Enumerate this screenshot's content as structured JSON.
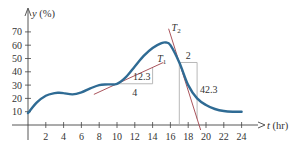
{
  "chart_data": {
    "type": "line",
    "title": "",
    "xlabel": "t (hr)",
    "ylabel": "y (%)",
    "x_axis_var": "t",
    "x_axis_unit": "(hr)",
    "y_axis_var": "y",
    "y_axis_unit": "(%)",
    "xlim": [
      0,
      24
    ],
    "ylim": [
      0,
      70
    ],
    "xticks": [
      2,
      4,
      6,
      8,
      10,
      12,
      14,
      16,
      18,
      20,
      22,
      24
    ],
    "yticks": [
      10,
      20,
      30,
      40,
      50,
      60,
      70
    ],
    "grid": false,
    "series": [
      {
        "name": "y(t)",
        "color": "#2f6b94",
        "x": [
          0,
          1,
          2,
          3,
          3.5,
          4,
          5,
          6,
          7,
          8,
          9,
          10,
          11,
          12,
          13,
          14,
          15,
          15.5,
          16,
          17,
          18,
          19,
          20,
          21,
          22,
          23,
          24
        ],
        "y": [
          9,
          17,
          22,
          24,
          24.2,
          24,
          23,
          24.5,
          27.5,
          30,
          30.5,
          31,
          36,
          44,
          52,
          58,
          61.5,
          62,
          60,
          47,
          30,
          20,
          15,
          12,
          10.5,
          10,
          10
        ]
      }
    ],
    "tangents": [
      {
        "name": "T1",
        "label": "T",
        "subscript": "1",
        "color": "#a0414a",
        "point": [
          10,
          31
        ],
        "run": 4,
        "rise": 12.3,
        "run_label": "4",
        "rise_label": "12.3"
      },
      {
        "name": "T2",
        "label": "T",
        "subscript": "2",
        "color": "#a0414a",
        "point": [
          17,
          47
        ],
        "run": 2,
        "rise": -42.3,
        "run_label": "2",
        "rise_label": "42.3"
      }
    ],
    "annotations": [
      "T1",
      "T2",
      "4",
      "12.3",
      "2",
      "42.3"
    ]
  },
  "style": {
    "curve_color": "#2f6b94",
    "tangent_color": "#a0414a",
    "box_color": "#b0b0b0",
    "axis_color": "#444444"
  }
}
